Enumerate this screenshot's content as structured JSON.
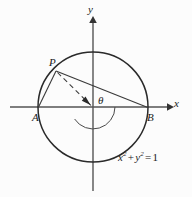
{
  "figure": {
    "background_color": "#fcfcfc",
    "stroke_color": "#1a1a1a",
    "axis_color": "#4a4a4a"
  },
  "axes": {
    "x_label": "x",
    "y_label": "y",
    "x_axis": {
      "x1": 10,
      "y1": 107,
      "x2": 172,
      "y2": 107
    },
    "y_axis": {
      "x1": 93,
      "y1": 18,
      "x2": 93,
      "y2": 191
    }
  },
  "circle": {
    "cx": 93,
    "cy": 107,
    "r": 55,
    "equation_parts": {
      "x": "x",
      "exp1": "2",
      "plus": "+",
      "y": "y",
      "exp2": "2",
      "equals": "=",
      "value": "1"
    },
    "equation_text": "x2 + y2 = 1"
  },
  "points": {
    "A": {
      "label": "A",
      "x": 38,
      "y": 107
    },
    "B": {
      "label": "B",
      "x": 148,
      "y": 107
    },
    "P": {
      "label": "P",
      "x": 56,
      "y": 71
    },
    "O": {
      "x": 93,
      "y": 107
    }
  },
  "angle": {
    "label": "θ",
    "arc_radius": 22,
    "start_deg": 0,
    "end_deg": 147
  },
  "segments": [
    {
      "name": "segment-PA",
      "from": "P",
      "to": "A",
      "style": "solid"
    },
    {
      "name": "segment-PB",
      "from": "P",
      "to": "B",
      "style": "solid"
    },
    {
      "name": "segment-PO",
      "from": "P",
      "to": "O",
      "style": "dashed"
    }
  ]
}
